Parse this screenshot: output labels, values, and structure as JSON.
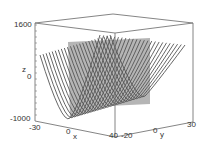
{
  "chart_data": {
    "type": "surface3d",
    "title": "",
    "xlabel": "x",
    "ylabel": "y",
    "zlabel": "z",
    "x_ticks": [
      "-30",
      "0",
      "40"
    ],
    "y_ticks": [
      "-20",
      "0",
      "30"
    ],
    "z_ticks": [
      "-1000",
      "0",
      "1600"
    ],
    "xlim": [
      -30,
      40
    ],
    "ylim": [
      -20,
      30
    ],
    "zlim": [
      -1000,
      1600
    ],
    "series": [
      {
        "name": "parabola-family",
        "style": "dark gray lines",
        "count": 24
      },
      {
        "name": "cut-plane",
        "style": "gray translucent plane"
      }
    ],
    "grid": false,
    "legend": "none"
  },
  "axes": {
    "z_top": "1600",
    "z_mid": "0",
    "z_bottom": "-1000",
    "z_label": "z",
    "x_left": "-30",
    "x_mid": "0",
    "x_right": "40",
    "x_label": "x",
    "y_left": "-20",
    "y_mid": "0",
    "y_right": "30",
    "y_label": "y"
  },
  "colors": {
    "curve": "#555555",
    "plane": "#a8a8a8",
    "frame": "#777777",
    "text": "#333333"
  }
}
